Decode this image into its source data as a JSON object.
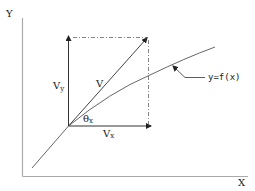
{
  "diagram": {
    "type": "vector-decomposition",
    "axes": {
      "x_label": "X",
      "y_label": "Y"
    },
    "vectors": {
      "resultant_label": "V",
      "x_component_label": "Vx",
      "y_component_label": "Vy",
      "angle_label": "θx"
    },
    "curve": {
      "label": "y=f(x)"
    },
    "colors": {
      "axis": "#aaaaaa",
      "line": "#444444",
      "text": "#222222"
    }
  }
}
